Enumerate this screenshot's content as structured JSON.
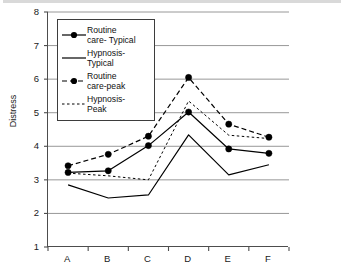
{
  "chart_data": {
    "type": "line",
    "title": "",
    "xlabel": "",
    "ylabel": "Distress",
    "categories": [
      "A",
      "B",
      "C",
      "D",
      "E",
      "F"
    ],
    "ylim": [
      1,
      8
    ],
    "yticks": [
      1,
      2,
      3,
      4,
      5,
      6,
      7,
      8
    ],
    "grid": "horizontal",
    "legend_position": "upper-left-inside",
    "series": [
      {
        "name": "Routine care- Typical",
        "legend_label": "Routine\ncare- Typical",
        "style": "solid",
        "marker": "filled-circle",
        "color": "#000000",
        "values": [
          3.22,
          3.27,
          4.02,
          5.02,
          3.92,
          3.79
        ]
      },
      {
        "name": "Hypnosis-Typical",
        "legend_label": "Hypnosis-\nTypical",
        "style": "solid",
        "marker": "none",
        "color": "#000000",
        "values": [
          2.85,
          2.46,
          2.55,
          4.34,
          3.15,
          3.45
        ]
      },
      {
        "name": "Routine care-peak",
        "legend_label": "Routine\ncare-peak",
        "style": "dashed",
        "marker": "filled-circle",
        "color": "#000000",
        "values": [
          3.42,
          3.76,
          4.3,
          6.05,
          4.66,
          4.27
        ]
      },
      {
        "name": "Hypnosis-Peak",
        "legend_label": "Hypnosis-\nPeak",
        "style": "dotted",
        "marker": "none",
        "color": "#000000",
        "values": [
          3.2,
          3.12,
          3.0,
          5.35,
          4.33,
          4.23
        ]
      }
    ]
  }
}
